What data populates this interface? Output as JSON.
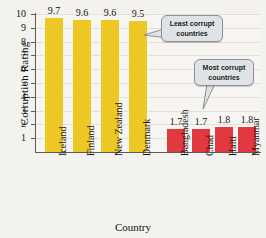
{
  "chart_data": {
    "type": "bar",
    "title": "",
    "xlabel": "Country",
    "ylabel": "Corruption Rating",
    "ylim": [
      0,
      10
    ],
    "ytick_labels": [
      "10",
      "9",
      "8",
      "7",
      "6",
      "5",
      "4",
      "3",
      "2",
      "1"
    ],
    "ytick_values": [
      10,
      9,
      8,
      7,
      6,
      5,
      4,
      3,
      2,
      1
    ],
    "grid": true,
    "legend": "none",
    "categories": [
      "Iceland",
      "Finland",
      "New Zealand",
      "Denmark",
      "Bangladesh",
      "Chad",
      "Haiti",
      "Myanmar"
    ],
    "values": [
      9.7,
      9.6,
      9.6,
      9.5,
      1.7,
      1.7,
      1.8,
      1.8
    ],
    "value_labels": [
      "9.7",
      "9.6",
      "9.6",
      "9.5",
      "1.7",
      "1.7",
      "1.8",
      "1.8"
    ],
    "bar_colors": [
      "#edc824",
      "#edc824",
      "#edc824",
      "#edc824",
      "#e2383f",
      "#e2383f",
      "#e2383f",
      "#e2383f"
    ],
    "annotations": [
      {
        "id": "least-corrupt",
        "line1": "Least corrupt",
        "line2": "countries"
      },
      {
        "id": "most-corrupt",
        "line1": "Most corrupt",
        "line2": "countries"
      }
    ]
  },
  "colors": {
    "least_corrupt_bar": "#edc824",
    "most_corrupt_bar": "#e2383f",
    "plot_background": "#f6f5f1",
    "page_background": "#f3f2ee",
    "axis": "#5a5a58",
    "gridline": "#e2e0d8",
    "callout_fill": "#dfe3e6",
    "callout_border": "#8b9196"
  }
}
